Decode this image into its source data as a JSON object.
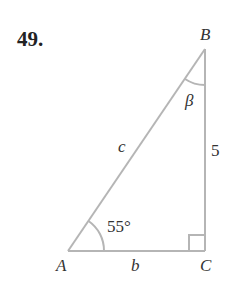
{
  "problem": {
    "number": "49."
  },
  "diagram": {
    "vertices": {
      "A": "A",
      "B": "B",
      "C": "C"
    },
    "sides": {
      "hypotenuse": "c",
      "base": "b",
      "vertical": "5"
    },
    "angles": {
      "at_A": "55°",
      "at_B": "β"
    },
    "line_color": "#b5b5b5"
  }
}
